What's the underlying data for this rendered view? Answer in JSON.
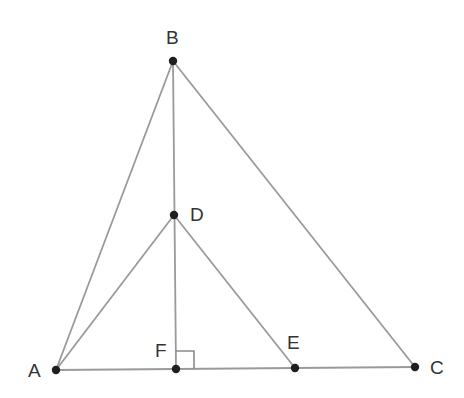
{
  "diagram": {
    "type": "geometry",
    "colors": {
      "background": "#ffffff",
      "line": "#9a9a9a",
      "point": "#1e1e1e",
      "label": "#333333"
    },
    "points": [
      {
        "id": "A",
        "label": "A",
        "x": 56,
        "y": 370,
        "lx": 28,
        "ly": 377
      },
      {
        "id": "B",
        "label": "B",
        "x": 173,
        "y": 61,
        "lx": 166,
        "ly": 44
      },
      {
        "id": "C",
        "label": "C",
        "x": 415,
        "y": 367,
        "lx": 430,
        "ly": 374
      },
      {
        "id": "D",
        "label": "D",
        "x": 174,
        "y": 215,
        "lx": 190,
        "ly": 221
      },
      {
        "id": "E",
        "label": "E",
        "x": 295,
        "y": 368,
        "lx": 287,
        "ly": 349
      },
      {
        "id": "F",
        "label": "F",
        "x": 176,
        "y": 369,
        "lx": 155,
        "ly": 357
      }
    ],
    "segments": [
      {
        "from": "A",
        "to": "B"
      },
      {
        "from": "B",
        "to": "C"
      },
      {
        "from": "A",
        "to": "C"
      },
      {
        "from": "B",
        "to": "F"
      },
      {
        "from": "A",
        "to": "D"
      },
      {
        "from": "D",
        "to": "E"
      }
    ],
    "right_angle_marker": {
      "at": "F",
      "label": "right-angle at F",
      "x": 176,
      "y": 351,
      "size": 18
    }
  }
}
